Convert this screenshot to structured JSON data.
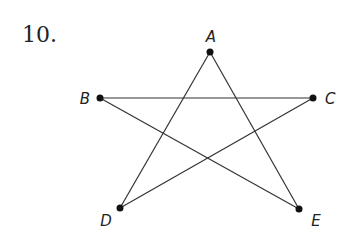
{
  "problem_number": "10.",
  "points": [
    {
      "label": "A",
      "x": 210,
      "y": 52,
      "lx": 211,
      "ly": 42,
      "anchor": "middle"
    },
    {
      "label": "B",
      "x": 100,
      "y": 98,
      "lx": 90,
      "ly": 104,
      "anchor": "end"
    },
    {
      "label": "C",
      "x": 313,
      "y": 98,
      "lx": 325,
      "ly": 104,
      "anchor": "start"
    },
    {
      "label": "D",
      "x": 120,
      "y": 208,
      "lx": 106,
      "ly": 226,
      "anchor": "middle"
    },
    {
      "label": "E",
      "x": 299,
      "y": 209,
      "lx": 316,
      "ly": 226,
      "anchor": "middle"
    }
  ],
  "segments": [
    [
      "A",
      "D"
    ],
    [
      "A",
      "E"
    ],
    [
      "B",
      "C"
    ],
    [
      "B",
      "E"
    ],
    [
      "C",
      "D"
    ]
  ],
  "colors": {
    "line": "#333333",
    "point": "#111111"
  }
}
